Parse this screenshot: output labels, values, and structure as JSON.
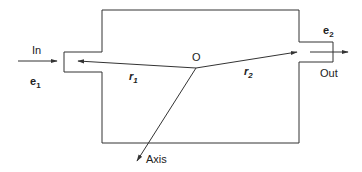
{
  "diagram": {
    "colors": {
      "stroke": "#333333",
      "text": "#222222",
      "background": "#ffffff"
    },
    "labels": {
      "inlet": "In",
      "outlet": "Out",
      "origin": "O",
      "axis": "Axis",
      "e1_base": "e",
      "e1_sub": "1",
      "e2_base": "e",
      "e2_sub": "2",
      "r1_base": "r",
      "r1_sub": "1",
      "r2_base": "r",
      "r2_sub": "2"
    }
  }
}
